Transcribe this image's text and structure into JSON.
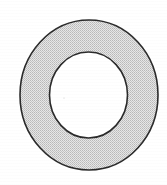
{
  "figure": {
    "name": "annulus-ring-diagram",
    "caption": "",
    "canvas": {
      "width": 167,
      "height": 185,
      "background_color": "#ffffff"
    },
    "shapes": {
      "outer_circle": {
        "label": "outer-circle",
        "center_x": 89,
        "center_y": 95,
        "radius_x": 69,
        "radius_y": 75,
        "stroke_color": "#2b2b2b",
        "stroke_width": 1.6,
        "fill_color": "#d9d9d9"
      },
      "inner_circle": {
        "label": "inner-circle",
        "center_x": 88.5,
        "center_y": 95,
        "radius_x": 39,
        "radius_y": 43,
        "stroke_color": "#2b2b2b",
        "stroke_width": 1.6,
        "fill_color": "#ffffff"
      }
    },
    "colors": {
      "outline": "#2b2b2b",
      "band_fill": "#d9d9d9",
      "hole_fill": "#ffffff",
      "paper": "#ffffff"
    },
    "texture": {
      "band_pattern": "halftone-dither",
      "dot_color": "#b4b4b4",
      "dot_spacing": 2
    }
  }
}
